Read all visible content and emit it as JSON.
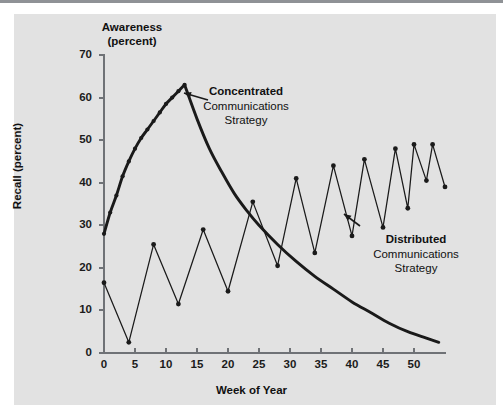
{
  "chart_data": {
    "type": "line",
    "title": "",
    "xlabel": "Week of Year",
    "ylabel": "Recall (percent)",
    "secondary_axis_label": "Awareness\n(percent)",
    "xlim": [
      0,
      55
    ],
    "ylim": [
      0,
      70
    ],
    "xticks": [
      0,
      5,
      10,
      15,
      20,
      25,
      30,
      35,
      40,
      45,
      50
    ],
    "yticks": [
      0,
      10,
      20,
      30,
      40,
      50,
      60,
      70
    ],
    "grid": false,
    "legend_position": "inline-annotations",
    "series": [
      {
        "name": "Concentrated Communications Strategy",
        "style": "thick-line-with-markers-then-smooth-decay",
        "points": [
          {
            "x": 0,
            "y": 28.0
          },
          {
            "x": 1,
            "y": 33.0
          },
          {
            "x": 2,
            "y": 37.0
          },
          {
            "x": 3,
            "y": 41.5
          },
          {
            "x": 4,
            "y": 45.0
          },
          {
            "x": 5,
            "y": 48.0
          },
          {
            "x": 6,
            "y": 50.5
          },
          {
            "x": 7,
            "y": 52.5
          },
          {
            "x": 8,
            "y": 54.5
          },
          {
            "x": 9,
            "y": 56.5
          },
          {
            "x": 10,
            "y": 58.5
          },
          {
            "x": 11,
            "y": 60.0
          },
          {
            "x": 12,
            "y": 61.5
          },
          {
            "x": 13,
            "y": 63.0
          },
          {
            "x": 15,
            "y": 55.0
          },
          {
            "x": 17,
            "y": 48.0
          },
          {
            "x": 19,
            "y": 42.5
          },
          {
            "x": 21,
            "y": 37.5
          },
          {
            "x": 23,
            "y": 33.5
          },
          {
            "x": 25,
            "y": 30.0
          },
          {
            "x": 28,
            "y": 25.5
          },
          {
            "x": 31,
            "y": 21.5
          },
          {
            "x": 34,
            "y": 18.0
          },
          {
            "x": 37,
            "y": 15.0
          },
          {
            "x": 40,
            "y": 12.0
          },
          {
            "x": 43,
            "y": 9.5
          },
          {
            "x": 46,
            "y": 7.0
          },
          {
            "x": 49,
            "y": 5.0
          },
          {
            "x": 52,
            "y": 3.5
          },
          {
            "x": 54,
            "y": 2.5
          }
        ]
      },
      {
        "name": "Distributed Communications Strategy",
        "style": "thin-sawtooth-with-markers",
        "points": [
          {
            "x": 0,
            "y": 16.5
          },
          {
            "x": 4,
            "y": 2.5
          },
          {
            "x": 8,
            "y": 25.5
          },
          {
            "x": 12,
            "y": 11.5
          },
          {
            "x": 16,
            "y": 29.0
          },
          {
            "x": 20,
            "y": 14.5
          },
          {
            "x": 24,
            "y": 35.5
          },
          {
            "x": 28,
            "y": 20.5
          },
          {
            "x": 31,
            "y": 41.0
          },
          {
            "x": 34,
            "y": 23.5
          },
          {
            "x": 37,
            "y": 44.0
          },
          {
            "x": 40,
            "y": 27.5
          },
          {
            "x": 42,
            "y": 45.5
          },
          {
            "x": 45,
            "y": 29.5
          },
          {
            "x": 47,
            "y": 48.0
          },
          {
            "x": 49,
            "y": 34.0
          },
          {
            "x": 50,
            "y": 49.0
          },
          {
            "x": 52,
            "y": 40.5
          },
          {
            "x": 53,
            "y": 49.0
          },
          {
            "x": 55,
            "y": 39.0
          }
        ]
      }
    ],
    "annotations": [
      {
        "id": "concentrated",
        "heading": "Concentrated",
        "lines": [
          "Communications",
          "Strategy"
        ],
        "points_at_x": 14,
        "points_at_y": 57
      },
      {
        "id": "distributed",
        "heading": "Distributed",
        "lines": [
          "Communications",
          "Strategy"
        ],
        "points_at_x": 40,
        "points_at_y": 27.5
      }
    ],
    "colors": {
      "panel_background": "#e2e2e2",
      "axis": "#6f7276",
      "series_line": "#1a1a1a",
      "text": "#111111",
      "top_rule": "#8f9296"
    }
  },
  "axis_titles": {
    "awareness_line1": "Awareness",
    "awareness_line2": "(percent)",
    "recall": "Recall (percent)",
    "week": "Week of Year"
  }
}
